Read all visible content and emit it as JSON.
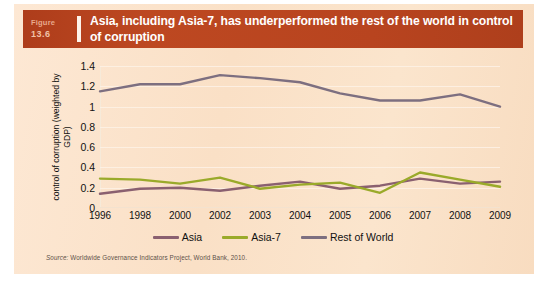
{
  "figure": {
    "label": "Figure",
    "number": "13.6",
    "title": "Asia, including Asia-7, has underperformed the rest of the world in control of corruption",
    "source_prefix": "Source:",
    "source_text": "Worldwide Governance Indicators Project, World Bank, 2010."
  },
  "colors": {
    "banner": "#b8441f",
    "panel": "#fbe3cb",
    "asia": "#8a6070",
    "asia7": "#9aaa2a",
    "rest_of_world": "#7d6f80",
    "gridline": "#fdf1e4"
  },
  "chart_data": {
    "type": "line",
    "title": "Asia, including Asia-7, has underperformed the rest of the world in control of corruption",
    "xlabel": "",
    "ylabel": "control of corruption (weighted by GDP)",
    "categories": [
      "1996",
      "1998",
      "2000",
      "2002",
      "2003",
      "2004",
      "2005",
      "2006",
      "2007",
      "2008",
      "2009"
    ],
    "ylim": [
      0,
      1.4
    ],
    "yticks": [
      0,
      0.2,
      0.4,
      0.6,
      0.8,
      1,
      1.2,
      1.4
    ],
    "ytick_labels": [
      "0",
      "0.2",
      "0.4",
      "0.6",
      "0.8",
      "1",
      "1.2",
      "1.4"
    ],
    "grid": true,
    "legend_position": "bottom",
    "series": [
      {
        "name": "Asia",
        "color": "#8a6070",
        "values": [
          0.14,
          0.19,
          0.2,
          0.17,
          0.22,
          0.26,
          0.19,
          0.22,
          0.29,
          0.24,
          0.26
        ]
      },
      {
        "name": "Asia-7",
        "color": "#9aaa2a",
        "values": [
          0.29,
          0.28,
          0.24,
          0.3,
          0.19,
          0.23,
          0.25,
          0.15,
          0.35,
          0.28,
          0.21
        ]
      },
      {
        "name": "Rest of World",
        "color": "#7d6f80",
        "values": [
          1.15,
          1.22,
          1.22,
          1.31,
          1.28,
          1.24,
          1.13,
          1.06,
          1.06,
          1.12,
          1.0
        ]
      }
    ]
  }
}
